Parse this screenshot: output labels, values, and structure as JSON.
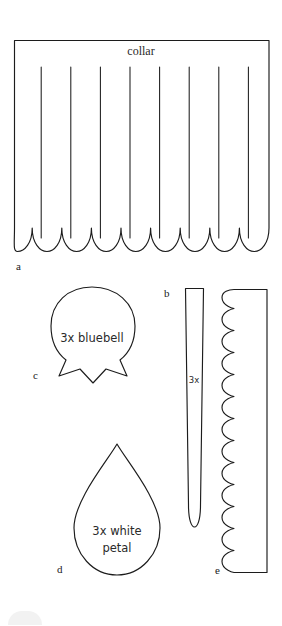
{
  "document": {
    "kind": "sewing-pattern-template-sheet",
    "background_color": "#ffffff",
    "ink_color": "#1c1c1c",
    "width": 282,
    "height": 626
  },
  "pieces": [
    {
      "id": "a",
      "label": "a",
      "caption": "collar",
      "shape": "scalloped-band",
      "scallops": 9,
      "slits": 8,
      "label_x": 16,
      "label_y": 270,
      "caption_x": 141,
      "caption_y": 55
    },
    {
      "id": "b",
      "label": "b",
      "caption": "3x",
      "shape": "narrow-tapered-strip",
      "label_x": 167,
      "label_y": 297,
      "caption_x": 191,
      "caption_y": 383
    },
    {
      "id": "c",
      "label": "c",
      "caption": "3x bluebell",
      "shape": "bell-flower-with-points",
      "label_x": 36,
      "label_y": 379,
      "caption_x": 92,
      "caption_y": 342
    },
    {
      "id": "d",
      "label": "d",
      "caption_line1": "3x white",
      "caption_line2": "petal",
      "shape": "teardrop-petal",
      "label_x": 60,
      "label_y": 572,
      "caption_x": 117,
      "caption_y": 535
    },
    {
      "id": "e",
      "label": "e",
      "caption": "",
      "shape": "scalloped-edge-strip",
      "scallops": 17,
      "label_x": 218,
      "label_y": 574
    }
  ]
}
